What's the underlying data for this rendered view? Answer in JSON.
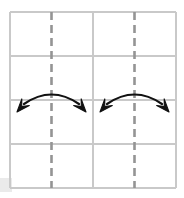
{
  "figure": {
    "canvas": {
      "width": 184,
      "height": 198,
      "background": "#ffffff"
    },
    "grid": {
      "name": "four-by-four-grid",
      "x0": 10,
      "y0": 12,
      "x1": 176,
      "y1": 188,
      "columns": 4,
      "rows": 4,
      "cell_width": 41.5,
      "cell_height": 44,
      "line_color": "#c9c9c9",
      "line_width": 1.2,
      "vertical_line_x": [
        10,
        51.5,
        93,
        134.5,
        176
      ],
      "horizontal_line_y": [
        12,
        56,
        100,
        144,
        188
      ]
    },
    "dashed_lines": [
      {
        "name": "mirror-line-left",
        "x": 51.5,
        "y_start": 12,
        "y_end": 188,
        "color": "#949494",
        "width": 2.6,
        "dash": "8 5"
      },
      {
        "name": "mirror-line-right",
        "x": 134.5,
        "y_start": 12,
        "y_end": 188,
        "color": "#949494",
        "width": 2.6,
        "dash": "8 5"
      }
    ],
    "arrows": [
      {
        "name": "reflection-arrow-left",
        "color": "#111111",
        "stroke_width": 2.2,
        "arc_start_x": 24,
        "arc_start_y": 104,
        "arc_apex_x": 51.5,
        "arc_apex_y": 90,
        "arc_end_x": 79,
        "arc_end_y": 104,
        "head_left_tip_x": 17,
        "head_left_tip_y": 112,
        "head_right_tip_x": 86,
        "head_right_tip_y": 112,
        "double_headed": true
      },
      {
        "name": "reflection-arrow-right",
        "color": "#111111",
        "stroke_width": 2.2,
        "arc_start_x": 107,
        "arc_start_y": 104,
        "arc_apex_x": 134.5,
        "arc_apex_y": 90,
        "arc_end_x": 162,
        "arc_end_y": 104,
        "head_left_tip_x": 100,
        "head_left_tip_y": 112,
        "head_right_tip_x": 169,
        "head_right_tip_y": 112,
        "double_headed": true
      }
    ],
    "shadow": {
      "name": "corner-shadow-artifact",
      "x": 0,
      "y": 178,
      "width": 12,
      "height": 14,
      "color": "#e8e8e8"
    }
  }
}
